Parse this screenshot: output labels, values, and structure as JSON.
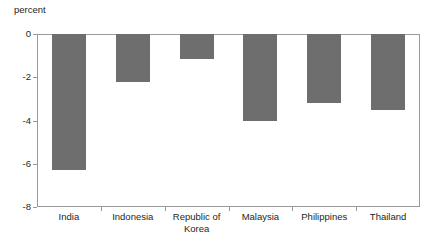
{
  "chart_data": {
    "type": "bar",
    "title": "",
    "subtitle": "",
    "xlabel": "",
    "ylabel": "percent",
    "categories": [
      "India",
      "Indonesia",
      "Republic of Korea",
      "Malaysia",
      "Philippines",
      "Thailand"
    ],
    "values": [
      -6.3,
      -2.2,
      -1.15,
      -4.0,
      -3.2,
      -3.5
    ],
    "series": [
      {
        "name": "percent",
        "values": [
          -6.3,
          -2.2,
          -1.15,
          -4.0,
          -3.2,
          -3.5
        ]
      }
    ],
    "ylim": [
      -8,
      0
    ],
    "ytick_labels": [
      "0",
      "-2",
      "-4",
      "-6",
      "-8"
    ],
    "ytick_values": [
      0,
      -2,
      -4,
      -6,
      -8
    ],
    "grid": false,
    "legend": false,
    "legend_position": "none",
    "bar_color": "#6e6e6e",
    "axis_color": "#9a9a9a",
    "text_color": "#231f20",
    "background": "#ffffff"
  }
}
